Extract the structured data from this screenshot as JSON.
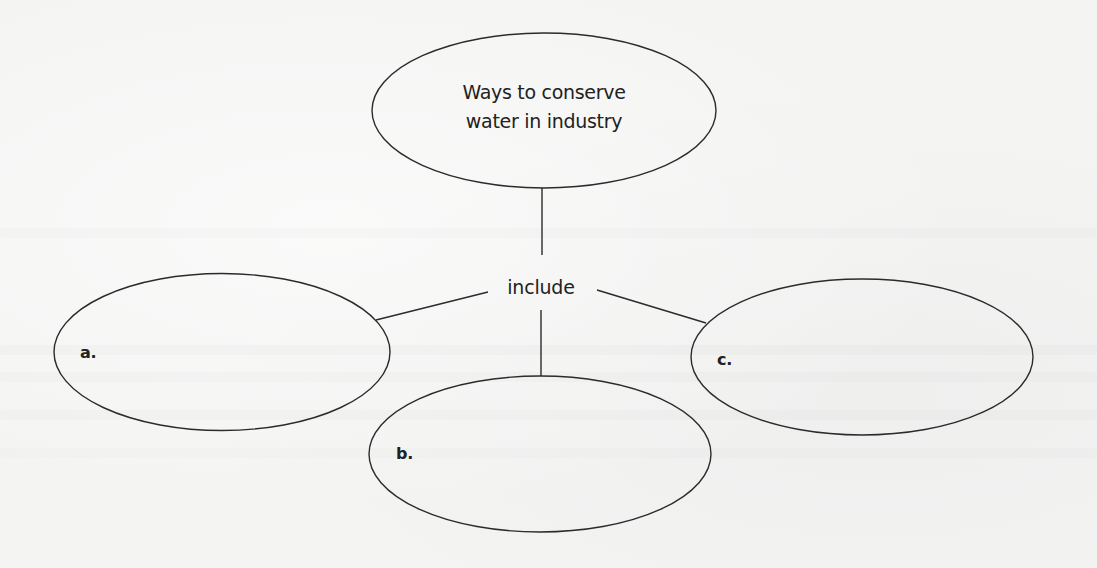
{
  "diagram": {
    "type": "concept-map",
    "central_node": {
      "lines": [
        "Ways to conserve",
        "water in industry"
      ]
    },
    "linking_word": "include",
    "blank_nodes": [
      {
        "label": "a.",
        "value": ""
      },
      {
        "label": "b.",
        "value": ""
      },
      {
        "label": "c.",
        "value": ""
      }
    ]
  },
  "colors": {
    "background": "#f4f4f3",
    "stroke": "#2b2b2b",
    "text": "#222222"
  }
}
